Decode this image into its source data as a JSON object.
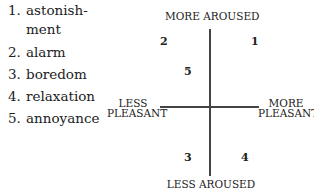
{
  "emotions_list": [
    {
      "number": "1.",
      "label": "astonish-",
      "label_cont": "ment"
    },
    {
      "number": "2.",
      "label": "alarm"
    },
    {
      "number": "3.",
      "label": "boredom"
    },
    {
      "number": "4.",
      "label": "relaxation"
    },
    {
      "number": "5.",
      "label": "annoyance"
    }
  ],
  "diagram": {
    "top_label": "MORE AROUSED",
    "bottom_label": "LESS AROUSED",
    "left_label_line1": "LESS",
    "left_label_line2": "PLEASANT",
    "right_label_line1": "MORE",
    "right_label_line2": "PLEASANT",
    "points": [
      {
        "id": "1",
        "quadrant": "more aroused / more pleasant"
      },
      {
        "id": "2",
        "quadrant": "more aroused / less pleasant"
      },
      {
        "id": "3",
        "quadrant": "less aroused / less pleasant"
      },
      {
        "id": "4",
        "quadrant": "less aroused / more pleasant"
      },
      {
        "id": "5",
        "quadrant": "more aroused / less pleasant (near center)"
      }
    ]
  }
}
